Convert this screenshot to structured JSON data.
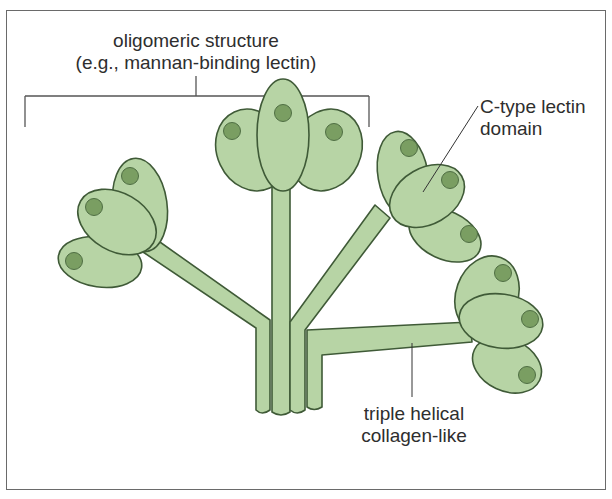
{
  "diagram": {
    "labels": {
      "oligomer_line1": "oligomeric structure",
      "oligomer_line2": "(e.g., mannan-binding lectin)",
      "lectin_line1": "C-type lectin",
      "lectin_line2": "domain",
      "collagen_line1": "triple helical",
      "collagen_line2": "collagen-like"
    },
    "colors": {
      "fill": "#b7d4a5",
      "stroke": "#3f5a37",
      "dot": "#7a9e62",
      "frame": "#6a6a6a",
      "text": "#2e2e2e"
    }
  }
}
